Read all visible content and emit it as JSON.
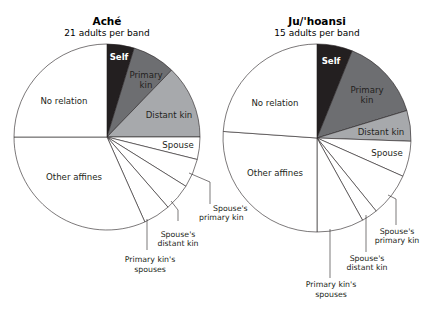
{
  "chart_data": [
    {
      "type": "pie",
      "title": "Aché",
      "subtitle": "21 adults per band",
      "start_angle": "top, clockwise",
      "slices": [
        {
          "label": "Self",
          "degrees": 17,
          "percent": 4.7,
          "color": "#231f20"
        },
        {
          "label": "Primary kin",
          "degrees": 27,
          "percent": 7.5,
          "color": "#6d6e71"
        },
        {
          "label": "Distant kin",
          "degrees": 46,
          "percent": 12.8,
          "color": "#a7a9ac"
        },
        {
          "label": "Spouse",
          "degrees": 14,
          "percent": 3.9,
          "color": "#ffffff"
        },
        {
          "label": "Spouse's primary kin",
          "degrees": 18,
          "percent": 5.0,
          "color": "#ffffff"
        },
        {
          "label": "Spouse's distant kin",
          "degrees": 17,
          "percent": 4.7,
          "color": "#ffffff"
        },
        {
          "label": "Primary kin's spouses",
          "degrees": 17,
          "percent": 4.7,
          "color": "#ffffff"
        },
        {
          "label": "Other affines",
          "degrees": 114,
          "percent": 31.7,
          "color": "#ffffff"
        },
        {
          "label": "No relation",
          "degrees": 90,
          "percent": 25.0,
          "color": "#ffffff"
        }
      ]
    },
    {
      "type": "pie",
      "title": "Ju/'hoansi",
      "subtitle": "15 adults per band",
      "start_angle": "top, clockwise",
      "slices": [
        {
          "label": "Self",
          "degrees": 22,
          "percent": 6.1,
          "color": "#231f20"
        },
        {
          "label": "Primary kin",
          "degrees": 51,
          "percent": 14.2,
          "color": "#6d6e71"
        },
        {
          "label": "Distant kin",
          "degrees": 19,
          "percent": 5.3,
          "color": "#a7a9ac"
        },
        {
          "label": "Spouse",
          "degrees": 22,
          "percent": 6.1,
          "color": "#ffffff"
        },
        {
          "label": "Spouse's primary kin",
          "degrees": 27,
          "percent": 7.5,
          "color": "#ffffff"
        },
        {
          "label": "Spouse's distant kin",
          "degrees": 10,
          "percent": 2.8,
          "color": "#ffffff"
        },
        {
          "label": "Primary kin's spouses",
          "degrees": 29,
          "percent": 8.1,
          "color": "#ffffff"
        },
        {
          "label": "Other affines",
          "degrees": 94,
          "percent": 26.1,
          "color": "#ffffff"
        },
        {
          "label": "No relation",
          "degrees": 86,
          "percent": 23.9,
          "color": "#ffffff"
        }
      ]
    }
  ],
  "labels": {
    "ache": {
      "title": "Aché",
      "subtitle": "21 adults per band",
      "self": "Self",
      "primary1": "Primary",
      "primary2": "kin",
      "distant": "Distant kin",
      "no_relation": "No relation",
      "spouse": "Spouse",
      "other_affines": "Other affines",
      "sp_primary1": "Spouse's",
      "sp_primary2": "primary kin",
      "sp_distant1": "Spouse's",
      "sp_distant2": "distant kin",
      "pk_spouses1": "Primary kin's",
      "pk_spouses2": "spouses"
    },
    "ju": {
      "title": "Ju/'hoansi",
      "subtitle": "15 adults per band",
      "self": "Self",
      "primary1": "Primary",
      "primary2": "kin",
      "distant": "Distant kin",
      "no_relation": "No relation",
      "spouse": "Spouse",
      "other_affines": "Other affines",
      "sp_primary1": "Spouse's",
      "sp_primary2": "primary kin",
      "sp_distant1": "Spouse's",
      "sp_distant2": "distant kin",
      "pk_spouses1": "Primary kin's",
      "pk_spouses2": "spouses"
    }
  }
}
